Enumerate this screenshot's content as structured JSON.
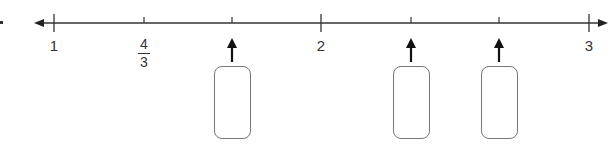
{
  "problem": {
    "bullet": "•"
  },
  "number_line": {
    "min": 1,
    "max": 3,
    "tick_step": "1/6",
    "labels": [
      {
        "value": "1",
        "x": 54
      },
      {
        "value_num": "4",
        "value_den": "3",
        "x": 144
      },
      {
        "value": "2",
        "x": 321
      },
      {
        "value": "3",
        "x": 589
      }
    ],
    "ticks_x": [
      54,
      144,
      232,
      321,
      411,
      499,
      589
    ],
    "answer_boxes": [
      {
        "tick_index": 2,
        "x": 232,
        "answer": ""
      },
      {
        "tick_index": 4,
        "x": 411,
        "answer": ""
      },
      {
        "tick_index": 5,
        "x": 499,
        "answer": ""
      }
    ],
    "colors": {
      "line": "#333333",
      "box_border": "#777777"
    }
  }
}
